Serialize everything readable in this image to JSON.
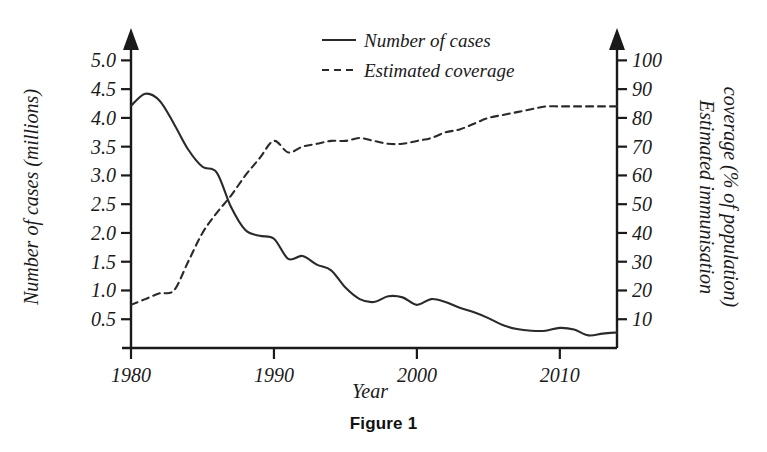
{
  "caption": "Figure 1",
  "chart_data": {
    "type": "line",
    "title": "",
    "xlabel": "Year",
    "ylabel": "Number of cases (millions)",
    "y2label_line1": "Estimated immunisation",
    "y2label_line2": "coverage (% of population)",
    "xlim": [
      1980,
      2014
    ],
    "ylim": [
      0,
      5.25
    ],
    "y2lim": [
      0,
      105
    ],
    "grid": false,
    "legend_position": "top-center",
    "xticks": [
      1980,
      1990,
      2000,
      2010
    ],
    "xtick_labels": [
      "1980",
      "1990",
      "2000",
      "2010"
    ],
    "yticks": [
      0.5,
      1.0,
      1.5,
      2.0,
      2.5,
      3.0,
      3.5,
      4.0,
      4.5,
      5.0
    ],
    "ytick_labels": [
      "0.5",
      "1.0",
      "1.5",
      "2.0",
      "2.5",
      "3.0",
      "3.5",
      "4.0",
      "4.5",
      "5.0"
    ],
    "y2ticks": [
      10,
      20,
      30,
      40,
      50,
      60,
      70,
      80,
      90,
      100
    ],
    "y2tick_labels": [
      "10",
      "20",
      "30",
      "40",
      "50",
      "60",
      "70",
      "80",
      "90",
      "100"
    ],
    "series": [
      {
        "name": "Number of cases",
        "legend_label": "Number of cases",
        "axis": "left",
        "style": "solid",
        "color": "#2a2a2a",
        "x": [
          1980,
          1981,
          1982,
          1983,
          1984,
          1985,
          1986,
          1987,
          1988,
          1989,
          1990,
          1991,
          1992,
          1993,
          1994,
          1995,
          1996,
          1997,
          1998,
          1999,
          2000,
          2001,
          2002,
          2003,
          2004,
          2005,
          2006,
          2007,
          2008,
          2009,
          2010,
          2011,
          2012,
          2013,
          2014
        ],
        "values": [
          4.21,
          4.42,
          4.3,
          3.9,
          3.45,
          3.15,
          3.05,
          2.45,
          2.05,
          1.95,
          1.9,
          1.55,
          1.6,
          1.45,
          1.35,
          1.05,
          0.85,
          0.8,
          0.9,
          0.88,
          0.75,
          0.85,
          0.8,
          0.7,
          0.62,
          0.52,
          0.4,
          0.33,
          0.3,
          0.3,
          0.35,
          0.32,
          0.22,
          0.25,
          0.27
        ]
      },
      {
        "name": "Estimated coverage",
        "legend_label": "Estimated coverage",
        "axis": "right",
        "style": "dashed",
        "color": "#2a2a2a",
        "x": [
          1980,
          1981,
          1982,
          1983,
          1984,
          1985,
          1986,
          1987,
          1988,
          1989,
          1990,
          1991,
          1992,
          1993,
          1994,
          1995,
          1996,
          1997,
          1998,
          1999,
          2000,
          2001,
          2002,
          2003,
          2004,
          2005,
          2006,
          2007,
          2008,
          2009,
          2010,
          2011,
          2012,
          2013,
          2014
        ],
        "values": [
          15,
          17,
          19,
          20,
          30,
          40,
          47,
          53,
          60,
          66,
          72,
          68,
          70,
          71,
          72,
          72,
          73,
          72,
          71,
          71,
          72,
          73,
          75,
          76,
          78,
          80,
          81,
          82,
          83,
          84,
          84,
          84,
          84,
          84,
          84
        ]
      }
    ]
  },
  "legend": {
    "items": [
      {
        "label": "Number of cases",
        "style": "solid"
      },
      {
        "label": "Estimated coverage",
        "style": "dashed"
      }
    ]
  }
}
